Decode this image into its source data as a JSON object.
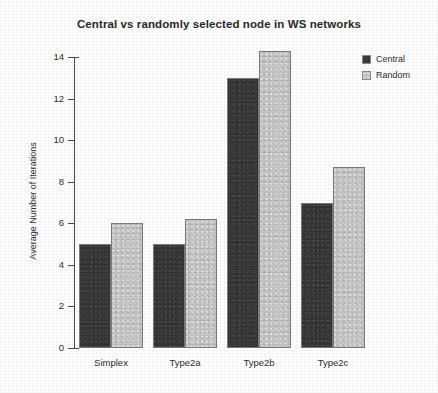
{
  "chart_data": {
    "type": "bar",
    "title": "Central vs randomly selected node in WS networks",
    "xlabel": "",
    "ylabel": "Average Number of Iterations",
    "categories": [
      "Simplex",
      "Type2a",
      "Type2b",
      "Type2c"
    ],
    "series": [
      {
        "name": "Central",
        "color": "#3a3a3a",
        "values": [
          5.0,
          5.0,
          13.0,
          7.0
        ]
      },
      {
        "name": "Random",
        "color": "#c8c8c8",
        "values": [
          6.0,
          6.2,
          14.3,
          8.7
        ]
      }
    ],
    "ylim": [
      0,
      14
    ],
    "yticks": [
      0,
      2,
      4,
      6,
      8,
      10,
      12,
      14
    ],
    "ytick_labels": [
      "0",
      "2",
      "4",
      "6",
      "8",
      "10",
      "12",
      "14"
    ],
    "grid": false,
    "legend_position": "top-right"
  },
  "legend": {
    "entries": [
      {
        "label": "Central"
      },
      {
        "label": "Random"
      }
    ]
  }
}
